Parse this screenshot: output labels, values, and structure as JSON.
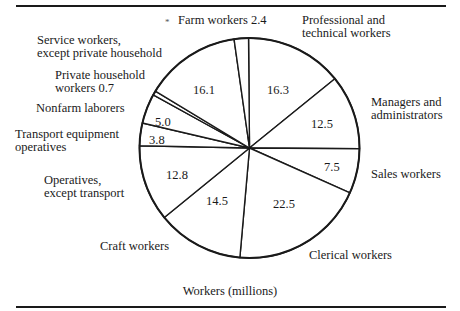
{
  "chart_data": {
    "type": "pie",
    "title": "",
    "caption": "Workers (millions)",
    "units": "millions",
    "start_angle_deg": -0.5,
    "direction": "clockwise",
    "slices": [
      {
        "label": "Professional and technical workers",
        "value": 16.3
      },
      {
        "label": "Managers and administrators",
        "value": 12.5
      },
      {
        "label": "Sales workers",
        "value": 7.5
      },
      {
        "label": "Clerical workers",
        "value": 22.5
      },
      {
        "label": "Craft workers",
        "value": 14.5
      },
      {
        "label": "Operatives, except transport",
        "value": 12.8
      },
      {
        "label": "Transport equipment operatives",
        "value": 3.8
      },
      {
        "label": "Nonfarm laborers",
        "value": 5.0
      },
      {
        "label": "Private household workers",
        "value": 0.7
      },
      {
        "label": "Service workers, except private household",
        "value": 16.1
      },
      {
        "label": "Farm workers",
        "value": 2.4
      }
    ],
    "total": 114.1
  },
  "labels": {
    "farm": "Farm workers 2.4",
    "farm_mark": "*",
    "professional_1": "Professional and",
    "professional_2": "technical workers",
    "managers_1": "Managers and",
    "managers_2": "administrators",
    "sales": "Sales workers",
    "clerical": "Clerical workers",
    "craft": "Craft workers",
    "operatives_1": "Operatives,",
    "operatives_2": "except transport",
    "transport_1": "Transport equipment",
    "transport_2": "operatives",
    "nonfarm": "Nonfarm laborers",
    "private_1": "Private household",
    "private_2": "workers 0.7",
    "service_1": "Service workers,",
    "service_2": "except private household"
  },
  "values": {
    "professional": "16.3",
    "managers": "12.5",
    "sales": "7.5",
    "clerical": "22.5",
    "craft": "14.5",
    "operatives": "12.8",
    "transport": "3.8",
    "nonfarm": "5.0",
    "service": "16.1"
  },
  "colors": {
    "ink": "#1a1a1a",
    "background": "#ffffff"
  }
}
